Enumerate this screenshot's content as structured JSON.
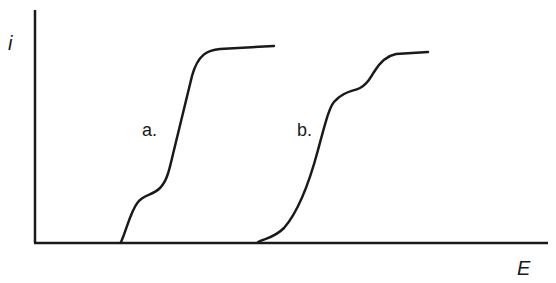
{
  "diagram": {
    "type": "polarographic-waves",
    "y_axis_label": "i",
    "x_axis_label": "E",
    "curves": [
      {
        "id": "a",
        "label": "a."
      },
      {
        "id": "b",
        "label": "b."
      }
    ],
    "colors": {
      "stroke": "#1a1a1a",
      "background": "#ffffff"
    }
  }
}
